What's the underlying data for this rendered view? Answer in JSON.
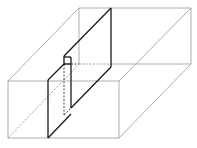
{
  "diagram": {
    "title": "",
    "colors": {
      "box_edges": "#9a9a9a",
      "section_edges": "#1a1a1a",
      "background": "#ffffff"
    },
    "box": {
      "front_face": {
        "x1": 8,
        "y1": 81,
        "x2": 119,
        "y2": 138
      },
      "back_face": {
        "x1": 79,
        "y1": 8,
        "x2": 191,
        "y2": 64
      }
    },
    "labels": []
  }
}
